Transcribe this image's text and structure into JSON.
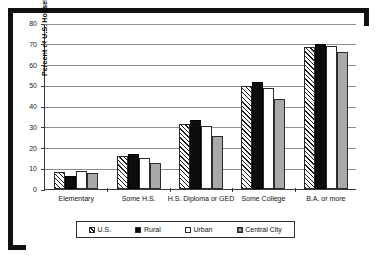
{
  "chart_data": {
    "type": "bar",
    "title": "",
    "xlabel": "",
    "ylabel": "Percent of U.S. Households",
    "ylim": [
      0,
      80
    ],
    "yticks": [
      0,
      10,
      20,
      30,
      40,
      50,
      60,
      70,
      80
    ],
    "grid": true,
    "legend_position": "bottom",
    "categories": [
      "Elementary",
      "Some H.S.",
      "H.S. Diploma or GED",
      "Some College",
      "B.A. or more"
    ],
    "series": [
      {
        "name": "U.S.",
        "values": [
          8.0,
          15.8,
          31.4,
          49.5,
          68.5
        ]
      },
      {
        "name": "Rural",
        "values": [
          6.4,
          17.0,
          33.4,
          51.5,
          70.0
        ]
      },
      {
        "name": "Urban",
        "values": [
          8.8,
          15.0,
          30.4,
          48.5,
          69.0
        ]
      },
      {
        "name": "Central City",
        "values": [
          7.8,
          12.6,
          25.5,
          43.5,
          66.0
        ]
      }
    ]
  },
  "axis": {
    "y_title": "Percent of U.S. Households",
    "y_labels": [
      "80",
      "70",
      "60",
      "50",
      "40",
      "30",
      "20",
      "10",
      "0"
    ],
    "x_labels": [
      "Elementary",
      "Some H.S.",
      "H.S. Diploma or GED",
      "Some College",
      "B.A. or more"
    ]
  },
  "legend": {
    "entries": [
      {
        "label": "U.S.",
        "swatch": "hatched-diagonal"
      },
      {
        "label": "Rural",
        "swatch": "solid-black"
      },
      {
        "label": "Urban",
        "swatch": "solid-white"
      },
      {
        "label": "Central City",
        "swatch": "gray-crosshatch"
      }
    ]
  },
  "colors": {
    "us": "#ffffff",
    "rural": "#0d0d0d",
    "urban": "#ffffff",
    "central_city": "#a9a9a9",
    "axis": "#3a3a3a",
    "grid": "#8d8d8d",
    "frame": "#111111"
  }
}
